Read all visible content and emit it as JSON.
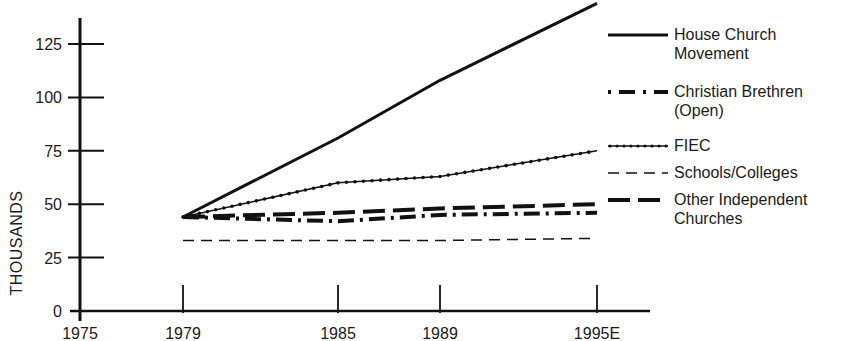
{
  "chart_data": {
    "type": "line",
    "title": "",
    "xlabel": "",
    "ylabel": "THOUSANDS",
    "x": [
      "1979",
      "1985",
      "1989",
      "1995E"
    ],
    "x_numeric": [
      1979,
      1985,
      1989,
      1995
    ],
    "x_ticks": [
      "1975",
      "1979",
      "1985",
      "1989",
      "1995E"
    ],
    "y_ticks": [
      "0",
      "25",
      "50",
      "75",
      "100",
      "125"
    ],
    "xlim": [
      1975,
      1997
    ],
    "ylim": [
      0,
      145
    ],
    "grid": false,
    "legend_position": "right",
    "series": [
      {
        "name": "House Church Movement",
        "label_lines": [
          "House Church",
          "Movement"
        ],
        "style": "solid",
        "values": [
          44,
          81,
          108,
          144
        ]
      },
      {
        "name": "Christian Brethren (Open)",
        "label_lines": [
          "Christian Brethren",
          "(Open)"
        ],
        "style": "dash-dot",
        "values": [
          44,
          42,
          45,
          46
        ]
      },
      {
        "name": "FIEC",
        "label_lines": [
          "FIEC"
        ],
        "style": "dotted-beaded",
        "values": [
          44,
          60,
          63,
          75
        ]
      },
      {
        "name": "Schools/Colleges",
        "label_lines": [
          "Schools/Colleges"
        ],
        "style": "thin-dashed",
        "values": [
          33,
          33,
          33,
          34
        ]
      },
      {
        "name": "Other Independent Churches",
        "label_lines": [
          "Other Independent",
          "Churches"
        ],
        "style": "long-dashed",
        "values": [
          44,
          46,
          48,
          50
        ]
      }
    ]
  }
}
